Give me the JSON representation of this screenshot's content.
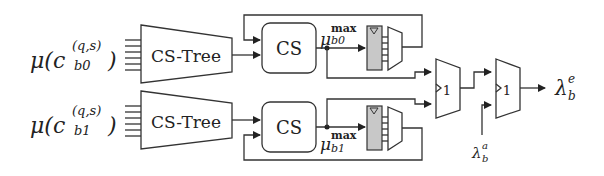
{
  "diagram": {
    "inputs": [
      {
        "label_base": "μ(c",
        "sup": "(q,s)",
        "sub": "b0",
        "close": ")"
      },
      {
        "label_base": "μ(c",
        "sup": "(q,s)",
        "sub": "b1",
        "close": ")"
      }
    ],
    "blocks": {
      "cs_tree_top": "CS-Tree",
      "cs_tree_bottom": "CS-Tree",
      "cs_top": "CS",
      "cs_bottom": "CS",
      "comparator_1": "1",
      "comparator_2": "1"
    },
    "signals": {
      "mu_top": {
        "base": "μ",
        "sup": "max",
        "sub": "b0"
      },
      "mu_bottom": {
        "base": "μ",
        "sup": "max",
        "sub": "b1"
      },
      "lambda_a": {
        "base": "λ",
        "sup": "a",
        "sub": "b"
      },
      "lambda_e": {
        "base": "λ",
        "sup": "e",
        "sub": "b"
      }
    },
    "colors": {
      "register_fill": "#c8c8c8",
      "stroke": "#333333"
    }
  }
}
